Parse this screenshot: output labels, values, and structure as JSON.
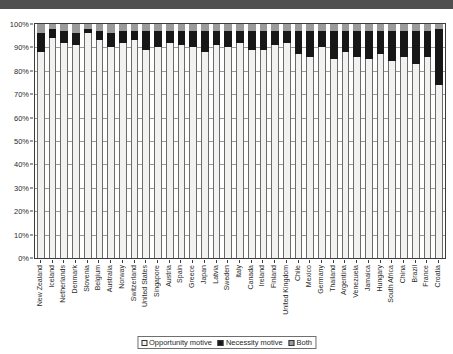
{
  "top_banner": {
    "fragments": [
      "",
      "",
      "",
      "",
      "",
      ""
    ]
  },
  "chart_data": {
    "type": "bar",
    "subtype": "stacked-100-percent",
    "title": "",
    "xlabel": "",
    "ylabel": "",
    "ylim": [
      0,
      100
    ],
    "ytick_labels": [
      "100%",
      "90%",
      "80%",
      "70%",
      "60%",
      "50%",
      "40%",
      "30%",
      "20%",
      "10%",
      "0%"
    ],
    "ytick_values": [
      100,
      90,
      80,
      70,
      60,
      50,
      40,
      30,
      20,
      10,
      0
    ],
    "grid": true,
    "legend_position": "bottom",
    "legend": [
      "Opportunity motive",
      "Necessity motive",
      "Both"
    ],
    "colors": {
      "opportunity": "#f2f2f0",
      "necessity": "#171717",
      "both": "#9b9b9b",
      "axis": "#3c3c3c",
      "grid": "#9a9a9a"
    },
    "categories": [
      "New Zealand",
      "Iceland",
      "Netherlands",
      "Denmark",
      "Slovenia",
      "Belgium",
      "Australia",
      "Norway",
      "Switzerland",
      "United States",
      "Singapore",
      "Austria",
      "Spain",
      "Greece",
      "Japan",
      "Latvia",
      "Sweden",
      "Italy",
      "Canada",
      "Ireland",
      "Finland",
      "United Kingdom",
      "Chile",
      "Mexico",
      "Germany",
      "Thailand",
      "Argentina",
      "Venezuela",
      "Jamaica",
      "Hungary",
      "South Africa",
      "China",
      "Brazil",
      "France",
      "Croatia"
    ],
    "series": [
      {
        "name": "Opportunity motive",
        "values": [
          88,
          94,
          92,
          91,
          96,
          93,
          90,
          92,
          93,
          89,
          90,
          92,
          91,
          90,
          88,
          91,
          90,
          92,
          89,
          89,
          91,
          92,
          87,
          86,
          90,
          85,
          88,
          86,
          85,
          87,
          84,
          86,
          83,
          86,
          74
        ]
      },
      {
        "name": "Necessity motive",
        "values": [
          8,
          4,
          5,
          5,
          2,
          4,
          6,
          5,
          4,
          8,
          7,
          5,
          6,
          7,
          9,
          6,
          7,
          5,
          8,
          8,
          6,
          5,
          10,
          11,
          7,
          12,
          9,
          11,
          12,
          10,
          13,
          11,
          14,
          11,
          24
        ]
      },
      {
        "name": "Both",
        "values": [
          4,
          2,
          3,
          4,
          2,
          3,
          4,
          3,
          3,
          3,
          3,
          3,
          3,
          3,
          3,
          3,
          3,
          3,
          3,
          3,
          3,
          3,
          3,
          3,
          3,
          3,
          3,
          3,
          3,
          3,
          3,
          3,
          3,
          3,
          2
        ]
      }
    ]
  }
}
